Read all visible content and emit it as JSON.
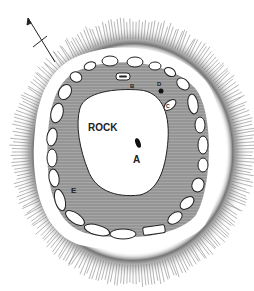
{
  "diagram": {
    "type": "plan",
    "labels": {
      "rock": "ROCK",
      "a": "A",
      "b": "B",
      "c": "C",
      "d": "D",
      "e": "E"
    },
    "north_arrow": "north-arrow",
    "colors": {
      "hatching": "#555555",
      "fill": "#9a9a9a",
      "outline": "#222222",
      "background": "#ffffff"
    }
  }
}
